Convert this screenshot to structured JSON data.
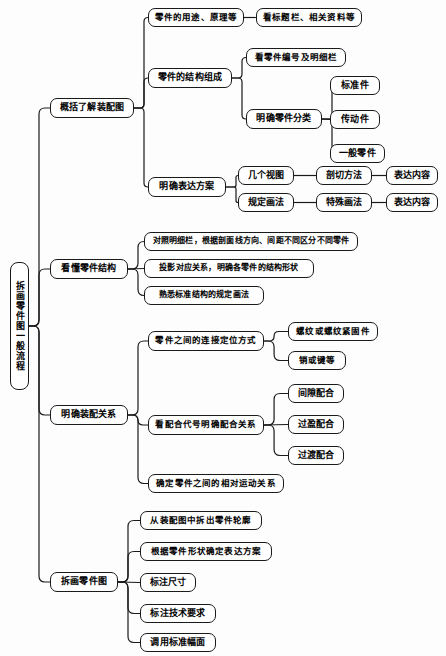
{
  "diagram": {
    "title": "拆画零件图一般流程",
    "style": {
      "line_color": "#1a1a1a",
      "box_border": "#1a1a1a",
      "box_fill": "#ffffff",
      "background": "#fdfdfd"
    },
    "root": {
      "id": "root",
      "label": "拆画零件图一般流程",
      "x": 10,
      "y": 262,
      "w": 19,
      "h": 128,
      "fs": 9
    },
    "nodes": [
      {
        "id": "n-gaikuo",
        "label": "概括了解装配图",
        "x": 50,
        "y": 98,
        "w": 84,
        "h": 20,
        "fs": 9
      },
      {
        "id": "n-yongtu",
        "label": "零件的用途、原理等",
        "x": 148,
        "y": 8,
        "w": 96,
        "h": 19,
        "fs": 8.5
      },
      {
        "id": "n-biaoti",
        "label": "看标题栏、相关资料等",
        "x": 256,
        "y": 8,
        "w": 106,
        "h": 19,
        "fs": 8.5
      },
      {
        "id": "n-jiegou",
        "label": "零件的结构组成",
        "x": 148,
        "y": 68,
        "w": 84,
        "h": 20,
        "fs": 9
      },
      {
        "id": "n-bianhao",
        "label": "看零件编号及明细栏",
        "x": 246,
        "y": 48,
        "w": 100,
        "h": 19,
        "fs": 8.5
      },
      {
        "id": "n-fenlei",
        "label": "明确零件分类",
        "x": 246,
        "y": 109,
        "w": 76,
        "h": 20,
        "fs": 9
      },
      {
        "id": "n-biaozhun",
        "label": "标准件",
        "x": 330,
        "y": 76,
        "w": 50,
        "h": 19,
        "fs": 9
      },
      {
        "id": "n-chuandong",
        "label": "传动件",
        "x": 330,
        "y": 110,
        "w": 50,
        "h": 19,
        "fs": 9
      },
      {
        "id": "n-yiban",
        "label": "一般零件",
        "x": 330,
        "y": 144,
        "w": 55,
        "h": 19,
        "fs": 9
      },
      {
        "id": "n-biaoda",
        "label": "明确表达方案",
        "x": 148,
        "y": 177,
        "w": 78,
        "h": 20,
        "fs": 9
      },
      {
        "id": "n-jigeshitu",
        "label": "几个视图",
        "x": 238,
        "y": 166,
        "w": 56,
        "h": 19,
        "fs": 9
      },
      {
        "id": "n-guiding",
        "label": "规定画法",
        "x": 238,
        "y": 193,
        "w": 56,
        "h": 19,
        "fs": 9
      },
      {
        "id": "n-pouqie",
        "label": "剖切方法",
        "x": 316,
        "y": 166,
        "w": 56,
        "h": 19,
        "fs": 9
      },
      {
        "id": "n-teshu",
        "label": "特殊画法",
        "x": 316,
        "y": 193,
        "w": 56,
        "h": 19,
        "fs": 9
      },
      {
        "id": "n-neirong1",
        "label": "表达内容",
        "x": 386,
        "y": 166,
        "w": 52,
        "h": 19,
        "fs": 9
      },
      {
        "id": "n-neirong2",
        "label": "表达内容",
        "x": 386,
        "y": 193,
        "w": 52,
        "h": 19,
        "fs": 9
      },
      {
        "id": "n-kandong",
        "label": "看懂零件结构",
        "x": 50,
        "y": 259,
        "w": 78,
        "h": 20,
        "fs": 9
      },
      {
        "id": "n-duizhao",
        "label": "对照明细栏，根据剖面线方向、间距不同区分不同零件",
        "x": 144,
        "y": 232,
        "w": 214,
        "h": 19,
        "fs": 8
      },
      {
        "id": "n-touying",
        "label": "投影对应关系，明确各零件的结构形状",
        "x": 144,
        "y": 259,
        "w": 170,
        "h": 19,
        "fs": 8
      },
      {
        "id": "n-shouxi",
        "label": "熟悉标准结构的规定画法",
        "x": 144,
        "y": 286,
        "w": 120,
        "h": 19,
        "fs": 8
      },
      {
        "id": "n-zhuangpei",
        "label": "明确装配关系",
        "x": 50,
        "y": 405,
        "w": 78,
        "h": 20,
        "fs": 9
      },
      {
        "id": "n-lianjie",
        "label": "零件之间的连接定位方式",
        "x": 148,
        "y": 331,
        "w": 116,
        "h": 20,
        "fs": 8.5
      },
      {
        "id": "n-luowen",
        "label": "螺纹或螺纹紧固件",
        "x": 288,
        "y": 322,
        "w": 90,
        "h": 19,
        "fs": 8.5
      },
      {
        "id": "n-xiaojian",
        "label": "销或键等",
        "x": 288,
        "y": 351,
        "w": 58,
        "h": 19,
        "fs": 8.5
      },
      {
        "id": "n-peihedh",
        "label": "看配合代号明确配合关系",
        "x": 148,
        "y": 415,
        "w": 116,
        "h": 20,
        "fs": 8.5
      },
      {
        "id": "n-jianxi",
        "label": "间隙配合",
        "x": 288,
        "y": 384,
        "w": 56,
        "h": 19,
        "fs": 9
      },
      {
        "id": "n-guoying",
        "label": "过盈配合",
        "x": 288,
        "y": 415,
        "w": 56,
        "h": 19,
        "fs": 9
      },
      {
        "id": "n-guodu",
        "label": "过渡配合",
        "x": 288,
        "y": 446,
        "w": 56,
        "h": 19,
        "fs": 9
      },
      {
        "id": "n-yundong",
        "label": "确定零件之间的相对运动关系",
        "x": 148,
        "y": 474,
        "w": 136,
        "h": 19,
        "fs": 8.5
      },
      {
        "id": "n-chaihua",
        "label": "拆画零件图",
        "x": 50,
        "y": 572,
        "w": 68,
        "h": 20,
        "fs": 9
      },
      {
        "id": "n-chaichu",
        "label": "从装配图中拆出零件轮廓",
        "x": 140,
        "y": 511,
        "w": 122,
        "h": 19,
        "fs": 8.5
      },
      {
        "id": "n-xingzhuang",
        "label": "根据零件形状确定表达方案",
        "x": 140,
        "y": 542,
        "w": 132,
        "h": 19,
        "fs": 8.5
      },
      {
        "id": "n-chicun",
        "label": "标注尺寸",
        "x": 140,
        "y": 573,
        "w": 56,
        "h": 19,
        "fs": 9
      },
      {
        "id": "n-jishu",
        "label": "标注技术要求",
        "x": 140,
        "y": 604,
        "w": 76,
        "h": 19,
        "fs": 9
      },
      {
        "id": "n-fumian",
        "label": "调用标准幅面",
        "x": 140,
        "y": 633,
        "w": 76,
        "h": 19,
        "fs": 9
      }
    ],
    "links": [
      {
        "from": "root",
        "to": "n-gaikuo"
      },
      {
        "from": "root",
        "to": "n-kandong"
      },
      {
        "from": "root",
        "to": "n-zhuangpei"
      },
      {
        "from": "root",
        "to": "n-chaihua"
      },
      {
        "from": "n-gaikuo",
        "to": "n-yongtu"
      },
      {
        "from": "n-gaikuo",
        "to": "n-jiegou"
      },
      {
        "from": "n-gaikuo",
        "to": "n-biaoda"
      },
      {
        "from": "n-yongtu",
        "to": "n-biaoti"
      },
      {
        "from": "n-jiegou",
        "to": "n-bianhao"
      },
      {
        "from": "n-jiegou",
        "to": "n-fenlei"
      },
      {
        "from": "n-fenlei",
        "to": "n-biaozhun"
      },
      {
        "from": "n-fenlei",
        "to": "n-chuandong"
      },
      {
        "from": "n-fenlei",
        "to": "n-yiban"
      },
      {
        "from": "n-biaoda",
        "to": "n-jigeshitu"
      },
      {
        "from": "n-biaoda",
        "to": "n-guiding"
      },
      {
        "from": "n-jigeshitu",
        "to": "n-pouqie"
      },
      {
        "from": "n-guiding",
        "to": "n-teshu"
      },
      {
        "from": "n-pouqie",
        "to": "n-neirong1"
      },
      {
        "from": "n-teshu",
        "to": "n-neirong2"
      },
      {
        "from": "n-kandong",
        "to": "n-duizhao"
      },
      {
        "from": "n-kandong",
        "to": "n-touying"
      },
      {
        "from": "n-kandong",
        "to": "n-shouxi"
      },
      {
        "from": "n-zhuangpei",
        "to": "n-lianjie"
      },
      {
        "from": "n-zhuangpei",
        "to": "n-peihedh"
      },
      {
        "from": "n-zhuangpei",
        "to": "n-yundong"
      },
      {
        "from": "n-lianjie",
        "to": "n-luowen"
      },
      {
        "from": "n-lianjie",
        "to": "n-xiaojian"
      },
      {
        "from": "n-peihedh",
        "to": "n-jianxi"
      },
      {
        "from": "n-peihedh",
        "to": "n-guoying"
      },
      {
        "from": "n-peihedh",
        "to": "n-guodu"
      },
      {
        "from": "n-chaihua",
        "to": "n-chaichu"
      },
      {
        "from": "n-chaihua",
        "to": "n-xingzhuang"
      },
      {
        "from": "n-chaihua",
        "to": "n-chicun"
      },
      {
        "from": "n-chaihua",
        "to": "n-jishu"
      },
      {
        "from": "n-chaihua",
        "to": "n-fumian"
      }
    ]
  }
}
